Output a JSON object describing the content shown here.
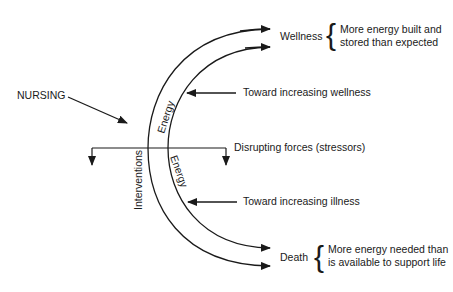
{
  "diagram": {
    "type": "energy-continuum",
    "nursing_label": "NURSING",
    "interventions_label": "Interventions",
    "energy_upper_label": "Energy",
    "energy_lower_label": "Energy",
    "wellness": {
      "label": "Wellness",
      "description_line1": "More energy built and",
      "description_line2": "stored than expected"
    },
    "death": {
      "label": "Death",
      "description_line1": "More energy needed than",
      "description_line2": "is available to support life"
    },
    "toward_wellness_label": "Toward increasing wellness",
    "toward_illness_label": "Toward increasing illness",
    "disrupting_forces_label": "Disrupting forces (stressors)",
    "line_color": "#1a1a1a"
  }
}
